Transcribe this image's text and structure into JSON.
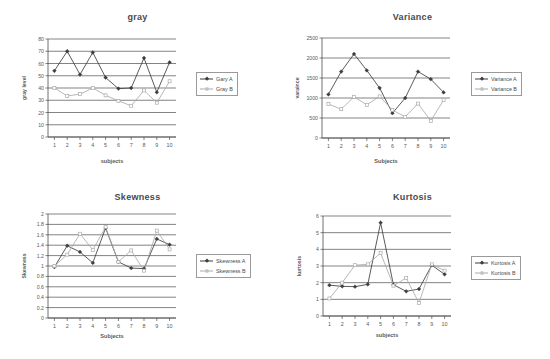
{
  "chart_data": [
    {
      "id": "gray",
      "type": "line",
      "title": "gray",
      "xlabel": "subjects",
      "ylabel": "gray level",
      "categories": [
        "1",
        "2",
        "3",
        "4",
        "5",
        "6",
        "7",
        "8",
        "9",
        "10"
      ],
      "x": [
        1,
        2,
        3,
        4,
        5,
        6,
        7,
        8,
        9,
        10
      ],
      "xlim": [
        0.5,
        10.5
      ],
      "ylim": [
        0,
        80
      ],
      "yticks": [
        0,
        10,
        20,
        30,
        40,
        50,
        60,
        70,
        80
      ],
      "grid": true,
      "legend_position": "right",
      "series": [
        {
          "name": "Gary A",
          "marker": "diamond",
          "color": "#3d3d3d",
          "values": [
            54,
            70,
            51,
            69,
            48.5,
            39.5,
            40,
            64.5,
            36.5,
            61
          ]
        },
        {
          "name": "Gray B",
          "marker": "square",
          "color": "#aaaaaa",
          "values": [
            40,
            33.5,
            35,
            40,
            34,
            29.5,
            25.5,
            38,
            28,
            45.5
          ]
        }
      ]
    },
    {
      "id": "variance",
      "type": "line",
      "title": "Variance",
      "xlabel": "Subjects",
      "ylabel": "varaince",
      "categories": [
        "1",
        "2",
        "3",
        "4",
        "5",
        "6",
        "7",
        "8",
        "9",
        "10"
      ],
      "x": [
        1,
        2,
        3,
        4,
        5,
        6,
        7,
        8,
        9,
        10
      ],
      "xlim": [
        0.5,
        10.5
      ],
      "ylim": [
        0,
        2500
      ],
      "yticks": [
        0,
        500,
        1000,
        1500,
        2000,
        2500
      ],
      "grid": true,
      "legend_position": "right",
      "series": [
        {
          "name": "Variance A",
          "marker": "diamond",
          "color": "#3d3d3d",
          "values": [
            1090,
            1660,
            2100,
            1690,
            1250,
            620,
            1000,
            1660,
            1470,
            1140
          ]
        },
        {
          "name": "Variance B",
          "marker": "square",
          "color": "#aaaaaa",
          "values": [
            850,
            720,
            1030,
            830,
            1040,
            700,
            530,
            860,
            430,
            950
          ]
        }
      ]
    },
    {
      "id": "skewness",
      "type": "line",
      "title": "Skewness",
      "xlabel": "Subjects",
      "ylabel": "Skewness",
      "categories": [
        "1",
        "2",
        "3",
        "4",
        "5",
        "6",
        "7",
        "8",
        "9",
        "10"
      ],
      "x": [
        1,
        2,
        3,
        4,
        5,
        6,
        7,
        8,
        9,
        10
      ],
      "xlim": [
        0.5,
        10.5
      ],
      "ylim": [
        0,
        2
      ],
      "yticks": [
        0,
        0.2,
        0.4,
        0.6,
        0.8,
        1,
        1.2,
        1.4,
        1.6,
        1.8,
        2
      ],
      "ytick_labels": [
        "0",
        "0.2",
        "0.4",
        "0.6",
        "0.8",
        "1",
        "1.2",
        "1.4",
        "1.6",
        "1.8",
        "2"
      ],
      "grid": true,
      "legend_position": "right",
      "series": [
        {
          "name": "Skewness A",
          "marker": "diamond",
          "color": "#3d3d3d",
          "values": [
            0.98,
            1.39,
            1.27,
            1.06,
            1.73,
            1.08,
            0.96,
            0.95,
            1.52,
            1.41
          ]
        },
        {
          "name": "Skewness B",
          "marker": "square",
          "color": "#aaaaaa",
          "values": [
            1.0,
            1.22,
            1.62,
            1.31,
            1.75,
            1.08,
            1.3,
            0.91,
            1.68,
            1.32
          ]
        }
      ]
    },
    {
      "id": "kurtosis",
      "type": "line",
      "title": "Kurtosis",
      "xlabel": "subjects",
      "ylabel": "kurtosis",
      "categories": [
        "1",
        "2",
        "3",
        "4",
        "5",
        "6",
        "7",
        "8",
        "9",
        "10"
      ],
      "x": [
        1,
        2,
        3,
        4,
        5,
        6,
        7,
        8,
        9,
        10
      ],
      "xlim": [
        0.5,
        10.5
      ],
      "ylim": [
        0,
        6
      ],
      "yticks": [
        0,
        1,
        2,
        3,
        4,
        5,
        6
      ],
      "grid": true,
      "legend_position": "right",
      "series": [
        {
          "name": "Kurtosis A",
          "marker": "diamond",
          "color": "#3d3d3d",
          "values": [
            1.85,
            1.78,
            1.76,
            1.9,
            5.6,
            1.88,
            1.48,
            1.62,
            3.05,
            2.5
          ]
        },
        {
          "name": "Kurtosis B",
          "marker": "square",
          "color": "#aaaaaa",
          "values": [
            1.05,
            2.0,
            3.05,
            3.1,
            3.78,
            1.82,
            2.28,
            0.78,
            3.1,
            2.72
          ]
        }
      ]
    }
  ]
}
